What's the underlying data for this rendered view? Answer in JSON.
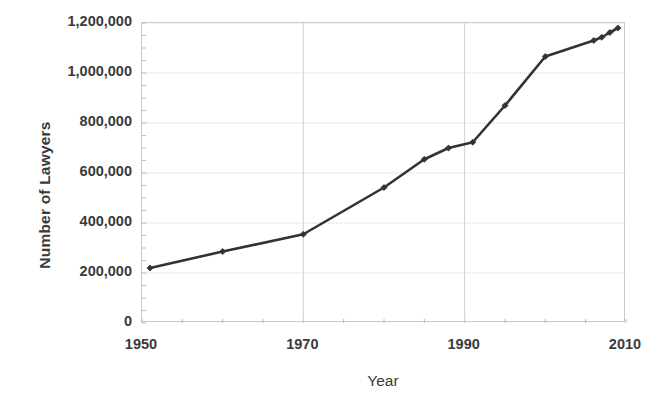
{
  "chart_data": {
    "type": "line",
    "title": "",
    "xlabel": "Year",
    "ylabel": "Number of Lawyers",
    "xlim": [
      1950,
      2010
    ],
    "ylim": [
      0,
      1200000
    ],
    "grid": true,
    "legend": false,
    "x_ticks": [
      "1950",
      "1970",
      "1990",
      "2010"
    ],
    "x_tick_values": [
      1950,
      1970,
      1990,
      2010
    ],
    "x_minor_tick_interval": 5,
    "y_ticks": [
      "0",
      "200,000",
      "400,000",
      "600,000",
      "800,000",
      "1,000,000",
      "1,200,000"
    ],
    "y_tick_values": [
      0,
      200000,
      400000,
      600000,
      800000,
      1000000,
      1200000
    ],
    "y_minor_tick_interval": 50000,
    "series": [
      {
        "name": "Number of Lawyers",
        "color": "#333333",
        "marker": "diamond",
        "x": [
          1951,
          1960,
          1970,
          1980,
          1985,
          1988,
          1991,
          1995,
          2000,
          2006,
          2007,
          2008,
          2009
        ],
        "values": [
          220000,
          286000,
          355000,
          542000,
          655000,
          700000,
          723000,
          870000,
          1066000,
          1130000,
          1143000,
          1162000,
          1180000
        ]
      }
    ]
  },
  "axes": {
    "y_title": "Number of Lawyers",
    "x_title": "Year"
  }
}
